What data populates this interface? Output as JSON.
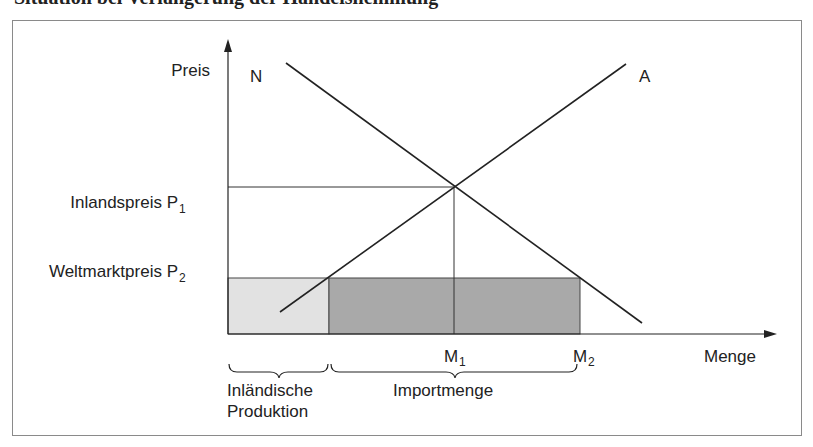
{
  "heading": "Situation bei Verlängerung der Handelshemmung",
  "axes": {
    "y_label": "Preis",
    "x_label": "Menge"
  },
  "curves": {
    "demand_label": "N",
    "supply_label": "A"
  },
  "price_levels": {
    "p1_label": "Inlandspreis P",
    "p1_sub": "1",
    "p2_label": "Weltmarktpreis P",
    "p2_sub": "2"
  },
  "quantities": {
    "m1_label": "M",
    "m1_sub": "1",
    "m2_label": "M",
    "m2_sub": "2"
  },
  "braces": {
    "domestic_line1": "Inländische",
    "domestic_line2": "Produktion",
    "imports": "Importmenge"
  },
  "colors": {
    "light_fill": "#e2e2e2",
    "dark_fill": "#a9a9a9",
    "line": "#222222",
    "frame": "#8a8a8a"
  }
}
